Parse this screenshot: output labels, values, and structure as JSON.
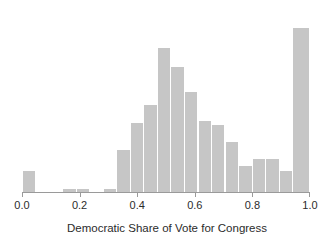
{
  "chart_data": {
    "type": "bar",
    "title": "",
    "subtitle": "",
    "xlabel": "Democratic Share of Vote for Congress",
    "ylabel": "",
    "grid": false,
    "legend": null,
    "xlim": [
      0.0,
      1.0
    ],
    "ylim": [
      0,
      175
    ],
    "xticks": [
      0.0,
      0.2,
      0.4,
      0.6,
      0.8,
      1.0
    ],
    "xtick_labels": [
      "0.0",
      "0.2",
      "0.4",
      "0.6",
      "0.8",
      "1.0"
    ],
    "bin_width": 0.047,
    "bar_color": "#c6c6c6",
    "axis_color": "#9a9a9a",
    "bins": [
      {
        "x0": 0.0,
        "x1": 0.047,
        "count": 20
      },
      {
        "x0": 0.047,
        "x1": 0.094,
        "count": 0
      },
      {
        "x0": 0.094,
        "x1": 0.141,
        "count": 0
      },
      {
        "x0": 0.141,
        "x1": 0.188,
        "count": 3
      },
      {
        "x0": 0.188,
        "x1": 0.235,
        "count": 3
      },
      {
        "x0": 0.235,
        "x1": 0.282,
        "count": 0
      },
      {
        "x0": 0.282,
        "x1": 0.329,
        "count": 3
      },
      {
        "x0": 0.329,
        "x1": 0.376,
        "count": 40
      },
      {
        "x0": 0.376,
        "x1": 0.423,
        "count": 66
      },
      {
        "x0": 0.423,
        "x1": 0.47,
        "count": 84
      },
      {
        "x0": 0.47,
        "x1": 0.517,
        "count": 138
      },
      {
        "x0": 0.517,
        "x1": 0.564,
        "count": 120
      },
      {
        "x0": 0.564,
        "x1": 0.611,
        "count": 96
      },
      {
        "x0": 0.611,
        "x1": 0.658,
        "count": 68
      },
      {
        "x0": 0.658,
        "x1": 0.705,
        "count": 64
      },
      {
        "x0": 0.705,
        "x1": 0.752,
        "count": 48
      },
      {
        "x0": 0.752,
        "x1": 0.799,
        "count": 25
      },
      {
        "x0": 0.799,
        "x1": 0.846,
        "count": 32
      },
      {
        "x0": 0.846,
        "x1": 0.893,
        "count": 32
      },
      {
        "x0": 0.893,
        "x1": 0.94,
        "count": 20
      },
      {
        "x0": 0.94,
        "x1": 1.0,
        "count": 158
      }
    ]
  },
  "axis": {
    "x_title": "Democratic Share of Vote for Congress",
    "tick_labels": [
      "0.0",
      "0.2",
      "0.4",
      "0.6",
      "0.8",
      "1.0"
    ]
  }
}
